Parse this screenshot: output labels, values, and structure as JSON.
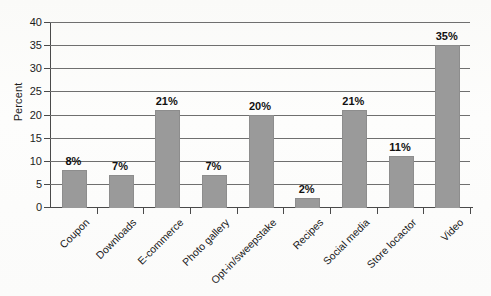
{
  "chart_data": {
    "type": "bar",
    "title": "",
    "xlabel": "",
    "ylabel": "Percent",
    "ylim": [
      0,
      40
    ],
    "ytick_step": 5,
    "yticks": [
      "40",
      "35",
      "30",
      "25",
      "20",
      "15",
      "10",
      "5",
      "0"
    ],
    "grid": true,
    "legend": null,
    "categories": [
      "Coupon",
      "Downloads",
      "E-commerce",
      "Photo gallery",
      "Opt-in/sweepstake",
      "Recipes",
      "Social media",
      "Store locactor",
      "Video"
    ],
    "values": [
      8,
      7,
      21,
      7,
      20,
      2,
      21,
      11,
      35
    ],
    "value_labels": [
      "8%",
      "7%",
      "21%",
      "7%",
      "20%",
      "2%",
      "21%",
      "11%",
      "35%"
    ],
    "bar_color": "#9a9a9a",
    "axis_color": "#4a4a4a",
    "gridline_color": "#6f6f6f",
    "background_color": "#fdfdfc"
  }
}
